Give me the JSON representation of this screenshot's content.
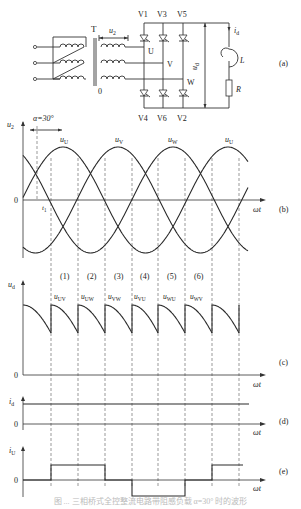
{
  "circuit": {
    "transformer_label": "T",
    "secondary_voltage_label": "u",
    "secondary_voltage_sub": "2",
    "neutral_label": "0",
    "phase_labels": [
      "U",
      "V",
      "W"
    ],
    "upper_thyristors": [
      "V1",
      "V3",
      "V5"
    ],
    "lower_thyristors": [
      "V4",
      "V6",
      "V2"
    ],
    "output_voltage_label": "u",
    "output_voltage_sub": "d",
    "current_label": "i",
    "current_sub": "d",
    "inductor_label": "L",
    "resistor_label": "R",
    "panel_tag": "(a)"
  },
  "panels": {
    "b": {
      "tag": "(b)",
      "ylabel": "u",
      "ylabel_sub": "2",
      "zero": "0",
      "xlabel": "ωt",
      "alpha_label": "α=30°",
      "t1_label": "t",
      "t1_sub": "1",
      "curve_labels": [
        {
          "t": "u",
          "s": "U"
        },
        {
          "t": "u",
          "s": "V"
        },
        {
          "t": "u",
          "s": "W"
        },
        {
          "t": "u",
          "s": "U"
        }
      ]
    },
    "c": {
      "tag": "(c)",
      "ylabel": "u",
      "ylabel_sub": "d",
      "zero": "0",
      "xlabel": "ωt",
      "intervals": [
        "(1)",
        "(2)",
        "(3)",
        "(4)",
        "(5)",
        "(6)"
      ],
      "segment_labels": [
        {
          "t": "u",
          "s": "UV"
        },
        {
          "t": "u",
          "s": "UW"
        },
        {
          "t": "u",
          "s": "VW"
        },
        {
          "t": "u",
          "s": "VU"
        },
        {
          "t": "u",
          "s": "WU"
        },
        {
          "t": "u",
          "s": "WV"
        }
      ]
    },
    "d": {
      "tag": "(d)",
      "ylabel": "i",
      "ylabel_sub": "d",
      "zero": "0",
      "xlabel": "ωt"
    },
    "e": {
      "tag": "(e)",
      "ylabel": "i",
      "ylabel_sub": "U",
      "zero": "0",
      "xlabel": "ωt"
    }
  },
  "caption": "图 ... 三相桥式全控整流电路带阻感负载 α=30° 时的波形",
  "chart_data": {
    "type": "line",
    "firing_angle_deg": 30,
    "b_phase_voltages": {
      "series": [
        {
          "name": "u_U",
          "phase_deg": 0
        },
        {
          "name": "u_V",
          "phase_deg": -120
        },
        {
          "name": "u_W",
          "phase_deg": -240
        }
      ],
      "x_range_deg": [
        -90,
        360
      ],
      "amplitude": 1.0
    },
    "c_output_voltage": {
      "segments": [
        "u_UV",
        "u_UW",
        "u_VW",
        "u_VU",
        "u_WU",
        "u_WV",
        "u_UV"
      ],
      "segment_width_deg": 60,
      "start_deg": 60,
      "value_range_pu": [
        1.225,
        1.732
      ]
    },
    "d_load_current": {
      "value": "constant I_d (ripple-free)"
    },
    "e_phase_current_iU": {
      "levels": [
        0,
        1,
        1,
        0,
        -1,
        -1,
        0,
        1
      ],
      "interval_width_deg": 60
    }
  }
}
